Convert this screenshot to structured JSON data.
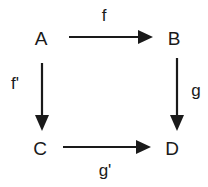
{
  "diagram": {
    "type": "commutative-square",
    "nodes": {
      "A": {
        "label": "A"
      },
      "B": {
        "label": "B"
      },
      "C": {
        "label": "C"
      },
      "D": {
        "label": "D"
      }
    },
    "edges": {
      "f": {
        "from": "A",
        "to": "B",
        "label": "f"
      },
      "f_prime": {
        "from": "A",
        "to": "C",
        "label": "f'"
      },
      "g": {
        "from": "B",
        "to": "D",
        "label": "g"
      },
      "g_prime": {
        "from": "C",
        "to": "D",
        "label": "g'"
      }
    },
    "colors": {
      "ink": "#1a1a1a",
      "background": "#ffffff"
    }
  }
}
